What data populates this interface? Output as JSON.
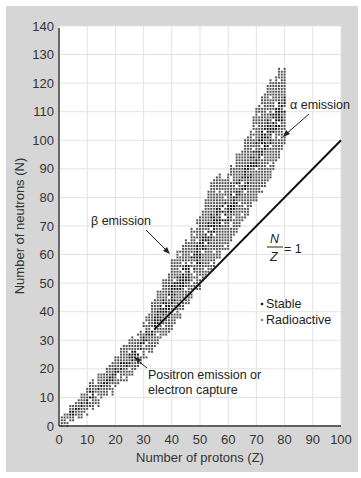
{
  "chart_data": {
    "type": "scatter",
    "title": "",
    "xlabel": "Number of protons (Z)",
    "ylabel": "Number of neutrons (N)",
    "xlim": [
      0,
      100
    ],
    "ylim": [
      0,
      140
    ],
    "xticks": [
      0,
      10,
      20,
      30,
      40,
      50,
      60,
      70,
      80,
      90,
      100
    ],
    "yticks": [
      0,
      10,
      20,
      30,
      40,
      50,
      60,
      70,
      80,
      90,
      100,
      110,
      120,
      130,
      140
    ],
    "grid": true,
    "legend": {
      "position": "inside-lower-right",
      "entries": [
        {
          "label": "Stable",
          "color": "#111111"
        },
        {
          "label": "Radioactive",
          "color": "#888888"
        }
      ]
    },
    "series": [
      {
        "name": "Band of nuclides (N range per Z)",
        "z": [
          1,
          5,
          10,
          15,
          20,
          25,
          30,
          35,
          40,
          45,
          50,
          55,
          60,
          65,
          70,
          75,
          80
        ],
        "n_min": [
          0,
          2,
          5,
          9,
          13,
          17,
          23,
          29,
          35,
          42,
          49,
          57,
          63,
          71,
          80,
          87,
          100
        ],
        "n_max": [
          2,
          7,
          13,
          18,
          24,
          29,
          35,
          47,
          58,
          64,
          73,
          86,
          88,
          97,
          110,
          120,
          126
        ]
      },
      {
        "name": "N/Z = 1 line",
        "type": "line",
        "x": [
          34,
          100
        ],
        "y": [
          34,
          100
        ]
      }
    ],
    "annotations": [
      {
        "text": "α emission",
        "x": 82,
        "y": 104,
        "arrow_to": [
          72,
          95
        ]
      },
      {
        "text": "β emission",
        "x": 20,
        "y": 72,
        "arrow_to": [
          38,
          62
        ]
      },
      {
        "text": "N/Z = 1",
        "x": 74,
        "y": 66
      },
      {
        "text": "Positron emission or electron capture",
        "x": 30,
        "y": 18,
        "arrow_to": [
          27,
          25
        ]
      }
    ]
  },
  "labels": {
    "xlabel": "Number of protons (Z)",
    "ylabel": "Number of neutrons (N)",
    "alpha": "α emission",
    "beta": "β emission",
    "ratio_num": "N",
    "ratio_den": "Z",
    "ratio_eq": "= 1",
    "positron_line1": "Positron emission or",
    "positron_line2": "electron capture",
    "legend_stable": "Stable",
    "legend_radio": "Radioactive"
  }
}
